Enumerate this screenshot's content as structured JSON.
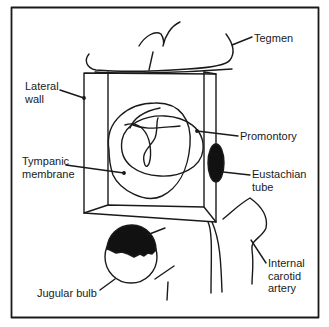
{
  "figure": {
    "type": "anatomical-diagram"
  },
  "labels": {
    "tegmen": "Tegmen",
    "lateral_wall": [
      "Lateral",
      "wall"
    ],
    "promontory": "Promontory",
    "tympanic_membrane": [
      "Tympanic",
      "membrane"
    ],
    "eustachian_tube": [
      "Eustachian",
      "tube"
    ],
    "jugular_bulb": "Jugular bulb",
    "internal_carotid_artery": [
      "Internal",
      "carotid",
      "artery"
    ]
  },
  "colors": {
    "line": "#1a1a1a",
    "background": "#ffffff",
    "fill_dark": "#111111"
  }
}
